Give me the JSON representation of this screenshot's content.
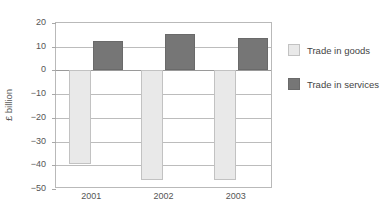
{
  "chart_data": {
    "type": "bar",
    "title": "",
    "subtitle": "",
    "xlabel": "",
    "ylabel": "£ billion",
    "categories": [
      "2001",
      "2002",
      "2003"
    ],
    "series": [
      {
        "name": "Trade in goods",
        "color": "#e9e9e9",
        "values": [
          -39.5,
          -46.0,
          -46.0
        ]
      },
      {
        "name": "Trade in services",
        "color": "#767676",
        "values": [
          12.5,
          15.5,
          13.5
        ]
      }
    ],
    "ylim": [
      -50,
      20
    ],
    "ytick_values": [
      20,
      10,
      0,
      -10,
      -20,
      -30,
      -40,
      -50
    ],
    "ytick_labels": [
      "20",
      "10",
      "0",
      "−10",
      "−20",
      "−30",
      "−40",
      "−50"
    ],
    "grid": true,
    "zero_line": 0,
    "legend_position": "right"
  },
  "legend": {
    "items": [
      {
        "label": "Trade in goods",
        "swatch": "goods-swatch"
      },
      {
        "label": "Trade in services",
        "swatch": "services-swatch"
      }
    ]
  },
  "axis": {
    "y_title": "£ billion"
  }
}
